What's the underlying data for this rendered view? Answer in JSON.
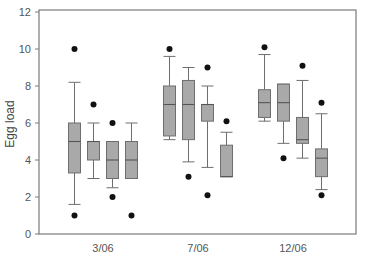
{
  "chart_data": {
    "type": "box",
    "title": "",
    "xlabel": "",
    "ylabel": "Egg load",
    "ylim": [
      0,
      12
    ],
    "yticks": [
      0,
      2,
      4,
      6,
      8,
      10,
      12
    ],
    "grid": false,
    "legend": null,
    "categories": [
      "3/06",
      "7/06",
      "12/06"
    ],
    "colors": {
      "box_fill": "#a9a9a9",
      "box_stroke": "#6e6e6e",
      "whisker": "#6e6e6e",
      "outlier": "#111111",
      "frame": "#7a7a7a"
    },
    "groups": [
      {
        "label": "3/06",
        "boxes": [
          {
            "whisker_low": 1.6,
            "q1": 3.3,
            "median": 5.0,
            "q3": 6.0,
            "whisker_high": 8.2,
            "outliers": [
              10,
              1
            ]
          },
          {
            "whisker_low": 3.0,
            "q1": 4.0,
            "median": 5.0,
            "q3": 5.0,
            "whisker_high": 6.0,
            "outliers": [
              7
            ]
          },
          {
            "whisker_low": 2.5,
            "q1": 3.0,
            "median": 4.0,
            "q3": 5.0,
            "whisker_high": 5.0,
            "outliers": [
              6,
              2
            ]
          },
          {
            "whisker_low": 3.0,
            "q1": 3.0,
            "median": 4.0,
            "q3": 5.0,
            "whisker_high": 6.0,
            "outliers": [
              1
            ]
          }
        ]
      },
      {
        "label": "7/06",
        "boxes": [
          {
            "whisker_low": 5.1,
            "q1": 5.3,
            "median": 7.0,
            "q3": 8.0,
            "whisker_high": 9.6,
            "outliers": [
              10
            ]
          },
          {
            "whisker_low": 3.9,
            "q1": 5.1,
            "median": 7.0,
            "q3": 8.3,
            "whisker_high": 9.0,
            "outliers": [
              3.1
            ]
          },
          {
            "whisker_low": 3.6,
            "q1": 6.1,
            "median": 7.0,
            "q3": 7.0,
            "whisker_high": 8.0,
            "outliers": [
              9.0,
              2.1
            ]
          },
          {
            "whisker_low": 3.1,
            "q1": 3.1,
            "median": 3.1,
            "q3": 4.8,
            "whisker_high": 5.5,
            "outliers": [
              6.1
            ]
          }
        ]
      },
      {
        "label": "12/06",
        "boxes": [
          {
            "whisker_low": 6.1,
            "q1": 6.3,
            "median": 7.1,
            "q3": 7.8,
            "whisker_high": 9.7,
            "outliers": [
              10.1
            ]
          },
          {
            "whisker_low": 4.9,
            "q1": 6.1,
            "median": 7.1,
            "q3": 8.1,
            "whisker_high": 8.1,
            "outliers": [
              4.1
            ]
          },
          {
            "whisker_low": 4.1,
            "q1": 4.9,
            "median": 5.1,
            "q3": 6.3,
            "whisker_high": 8.3,
            "outliers": [
              9.1
            ]
          },
          {
            "whisker_low": 2.4,
            "q1": 3.1,
            "median": 4.1,
            "q3": 4.6,
            "whisker_high": 6.5,
            "outliers": [
              7.1,
              2.1
            ]
          }
        ]
      }
    ]
  }
}
